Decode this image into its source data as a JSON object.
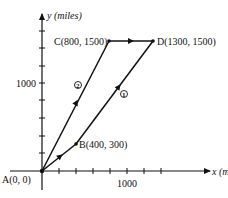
{
  "diagram": {
    "axes": {
      "x_label": "x (miles)",
      "y_label": "y (miles)",
      "x_tick_label": "1000",
      "y_tick_label": "1000",
      "x_ticks": [
        200,
        400,
        600,
        800,
        1000,
        1200,
        1400
      ],
      "y_ticks": [
        200,
        400,
        600,
        800,
        1000,
        1200,
        1400,
        1600
      ]
    },
    "points": [
      {
        "id": "A",
        "label": "A(0, 0)",
        "x": 0,
        "y": 0
      },
      {
        "id": "B",
        "label": "B(400, 300)",
        "x": 400,
        "y": 300
      },
      {
        "id": "C",
        "label": "C(800, 1500)",
        "x": 800,
        "y": 1500
      },
      {
        "id": "D",
        "label": "D(1300, 1500)",
        "x": 1300,
        "y": 1500
      }
    ],
    "paths": [
      {
        "id": "path-1",
        "label": "1",
        "route": [
          "A",
          "B",
          "D"
        ]
      },
      {
        "id": "path-2",
        "label": "2",
        "route": [
          "A",
          "C",
          "D"
        ]
      }
    ],
    "colors": {
      "ink": "#111111",
      "background": "#ffffff"
    }
  }
}
